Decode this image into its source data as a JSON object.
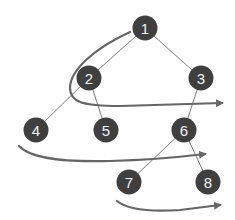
{
  "diagram": {
    "type": "binary-tree-level-order-traversal",
    "colors": {
      "node_fill": "#3f3f3f",
      "node_text": "#f2f2f2",
      "edge": "#7a7a7a",
      "arrow": "#666666"
    },
    "nodes": [
      {
        "id": "1",
        "label": "1",
        "x": 145,
        "y": 28
      },
      {
        "id": "2",
        "label": "2",
        "x": 89,
        "y": 78
      },
      {
        "id": "3",
        "label": "3",
        "x": 201,
        "y": 78
      },
      {
        "id": "4",
        "label": "4",
        "x": 36,
        "y": 130
      },
      {
        "id": "5",
        "label": "5",
        "x": 106,
        "y": 130
      },
      {
        "id": "6",
        "label": "6",
        "x": 184,
        "y": 130
      },
      {
        "id": "7",
        "label": "7",
        "x": 129,
        "y": 182
      },
      {
        "id": "8",
        "label": "8",
        "x": 208,
        "y": 182
      }
    ],
    "edges": [
      [
        "1",
        "2"
      ],
      [
        "1",
        "3"
      ],
      [
        "2",
        "4"
      ],
      [
        "2",
        "5"
      ],
      [
        "3",
        "6"
      ],
      [
        "6",
        "7"
      ],
      [
        "6",
        "8"
      ]
    ],
    "traversal_arrows": [
      {
        "from_level": 1,
        "to_level": 2,
        "description": "from 1 curving down through 2 toward right past 3"
      },
      {
        "from_level": 3,
        "description": "sweep under 4, 5 toward 6"
      },
      {
        "from_level": 4,
        "description": "sweep under 7 toward 8"
      }
    ]
  }
}
